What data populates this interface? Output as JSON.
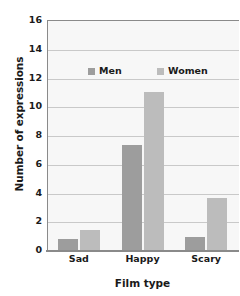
{
  "chart_data": {
    "type": "bar",
    "title": "",
    "xlabel": "Film type",
    "ylabel": "Number of expressions",
    "categories": [
      "Sad",
      "Happy",
      "Scary"
    ],
    "series": [
      {
        "name": "Men",
        "values": [
          0.8,
          7.3,
          0.9
        ],
        "color": "#9d9d9d"
      },
      {
        "name": "Women",
        "values": [
          1.4,
          11.0,
          3.6
        ],
        "color": "#bcbcbc"
      }
    ],
    "ylim": [
      0,
      16
    ],
    "ytick_labels": [
      "0",
      "2",
      "4",
      "6",
      "8",
      "10",
      "12",
      "14",
      "16"
    ],
    "ytick_values": [
      0,
      2,
      4,
      6,
      8,
      10,
      12,
      14,
      16
    ],
    "grid": true,
    "legend_position": "inside-top",
    "plot_background": "#f7f7f7",
    "gridline_color": "#c9c9c9",
    "axis_color": "#8a8a8a",
    "text_color": "#1a1a1a"
  }
}
